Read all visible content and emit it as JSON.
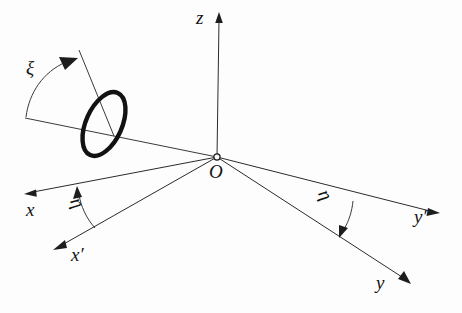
{
  "figure": {
    "background_color": "#fdfdfd",
    "line_color": "#2b2b2b",
    "ring_color": "#121212",
    "width": 462,
    "height": 313
  },
  "labels": {
    "z_axis": "z",
    "origin": "O",
    "x_axis": "x",
    "x_prime_axis": "x′",
    "y_axis": "y",
    "y_prime_axis": "y′",
    "xi_angle": "ξ",
    "eta_angle_left": "η",
    "eta_angle_right": "η"
  },
  "diagram_data": {
    "type": "vector-diagram",
    "origin_px": [
      217,
      157
    ],
    "axes": [
      {
        "name": "z",
        "label": "z",
        "from_px": [
          217,
          157
        ],
        "to_px": [
          219,
          14
        ],
        "arrow": true
      },
      {
        "name": "x",
        "label": "x",
        "from_px": [
          217,
          157
        ],
        "to_px": [
          26,
          193
        ],
        "arrow": true
      },
      {
        "name": "x-prime",
        "label": "x′",
        "from_px": [
          217,
          157
        ],
        "to_px": [
          55,
          248
        ],
        "arrow": true
      },
      {
        "name": "y",
        "label": "y",
        "from_px": [
          217,
          157
        ],
        "to_px": [
          410,
          283
        ],
        "arrow": true
      },
      {
        "name": "y-prime",
        "label": "y′",
        "from_px": [
          217,
          157
        ],
        "to_px": [
          439,
          213
        ],
        "arrow": true
      },
      {
        "name": "ring-plane-line",
        "label": "",
        "from_px": [
          217,
          157
        ],
        "to_px": [
          25,
          118
        ],
        "arrow": false
      },
      {
        "name": "ring-normal-line",
        "label": "",
        "from_px": [
          112,
          130
        ],
        "to_px": [
          79,
          50
        ],
        "arrow": false
      }
    ],
    "ring": {
      "center_px": [
        104,
        124
      ],
      "rx": 18,
      "ry": 34,
      "rotation_deg": 24,
      "stroke_width": 4.4
    },
    "angles": [
      {
        "name": "xi",
        "label": "ξ",
        "between": [
          "ring-plane-line",
          "ring-normal-line"
        ],
        "arrow_at": "end"
      },
      {
        "name": "eta-left",
        "label": "η",
        "between": [
          "x-prime",
          "x"
        ],
        "arrow_at": "end"
      },
      {
        "name": "eta-right",
        "label": "η",
        "between": [
          "y-prime",
          "y"
        ],
        "arrow_at": "end"
      }
    ]
  }
}
